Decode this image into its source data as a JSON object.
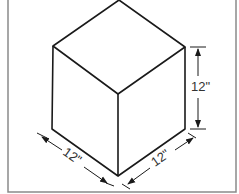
{
  "figure": {
    "type": "isometric-cube",
    "dimensions": {
      "height_label": "12\"",
      "left_depth_label": "12\"",
      "right_width_label": "12\""
    },
    "colors": {
      "line": "#1a1a1a",
      "border": "#8a8a8a",
      "background": "#ffffff"
    }
  }
}
